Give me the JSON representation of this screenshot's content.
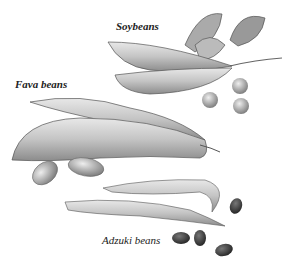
{
  "labels": {
    "soybeans": "Soybeans",
    "fava": "Fava beans",
    "adzuki": "Adzuki beans"
  },
  "colors": {
    "ink": "#222222",
    "pod": "#bdbdbd",
    "pod_dark": "#7a7a7a",
    "adzuki": "#3a3a3a"
  }
}
